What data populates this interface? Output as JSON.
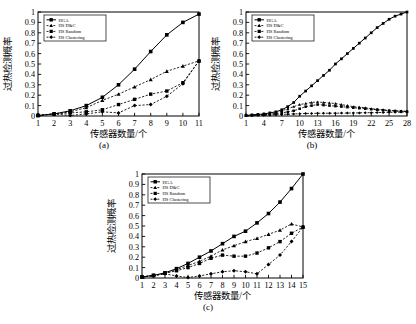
{
  "figure": {
    "axis_labels": {
      "x": "传感器数量/个",
      "y": "过热检测概率"
    },
    "series_names": [
      "HGA",
      "HS D&C",
      "HS Random",
      "HS Clustering"
    ],
    "captions": {
      "a": "(a)",
      "b": "(b)",
      "c": "(c)"
    }
  },
  "chart_data": [
    {
      "type": "line",
      "panel": "(a)",
      "title": "",
      "xlabel": "传感器数量/个",
      "ylabel": "过热检测概率",
      "xlim": [
        1,
        11
      ],
      "ylim": [
        0,
        1
      ],
      "xticks": [
        1,
        2,
        3,
        4,
        5,
        6,
        7,
        8,
        9,
        10,
        11
      ],
      "yticks": [
        0,
        0.1,
        0.2,
        0.3,
        0.4,
        0.5,
        0.6,
        0.7,
        0.8,
        0.9,
        1
      ],
      "grid": false,
      "legend_position": "top-left",
      "x": [
        1,
        2,
        3,
        4,
        5,
        6,
        7,
        8,
        9,
        10,
        11
      ],
      "series": [
        {
          "name": "HGA",
          "marker": "square",
          "linestyle": "solid",
          "values": [
            0.005,
            0.02,
            0.05,
            0.1,
            0.18,
            0.3,
            0.45,
            0.62,
            0.78,
            0.9,
            0.98
          ]
        },
        {
          "name": "HS D&C",
          "marker": "triangle",
          "linestyle": "dashed",
          "values": [
            0.005,
            0.02,
            0.04,
            0.08,
            0.15,
            0.21,
            0.28,
            0.35,
            0.43,
            0.48,
            0.53
          ]
        },
        {
          "name": "HS Random",
          "marker": "square-small",
          "linestyle": "dashed",
          "values": [
            0.005,
            0.02,
            0.03,
            0.04,
            0.06,
            0.11,
            0.16,
            0.21,
            0.24,
            0.32,
            0.53
          ]
        },
        {
          "name": "HS Clustering",
          "marker": "diamond",
          "linestyle": "dashed",
          "values": [
            0.005,
            0.02,
            0.005,
            0.02,
            0.04,
            0.03,
            0.1,
            0.11,
            0.19,
            0.31,
            0.53
          ]
        }
      ]
    },
    {
      "type": "line",
      "panel": "(b)",
      "title": "",
      "xlabel": "传感器数量/个",
      "ylabel": "过热检测概率",
      "xlim": [
        1,
        28
      ],
      "ylim": [
        0,
        1
      ],
      "xticks": [
        1,
        4,
        7,
        10,
        13,
        16,
        19,
        22,
        25,
        28
      ],
      "yticks": [
        0,
        0.1,
        0.2,
        0.3,
        0.4,
        0.5,
        0.6,
        0.7,
        0.8,
        0.9,
        1
      ],
      "grid": false,
      "legend_position": "top-left",
      "x": [
        1,
        2,
        3,
        4,
        5,
        6,
        7,
        8,
        9,
        10,
        11,
        12,
        13,
        14,
        15,
        16,
        17,
        18,
        19,
        20,
        21,
        22,
        23,
        24,
        25,
        26,
        27,
        28
      ],
      "series": [
        {
          "name": "HGA",
          "marker": "square",
          "linestyle": "solid",
          "values": [
            0.005,
            0.01,
            0.015,
            0.02,
            0.03,
            0.04,
            0.06,
            0.09,
            0.13,
            0.19,
            0.24,
            0.29,
            0.34,
            0.39,
            0.44,
            0.5,
            0.55,
            0.6,
            0.65,
            0.7,
            0.75,
            0.8,
            0.85,
            0.89,
            0.93,
            0.96,
            0.98,
            1.0
          ]
        },
        {
          "name": "HS D&C",
          "marker": "triangle",
          "linestyle": "dashed",
          "values": [
            0.005,
            0.01,
            0.012,
            0.015,
            0.02,
            0.03,
            0.05,
            0.07,
            0.09,
            0.11,
            0.12,
            0.13,
            0.135,
            0.13,
            0.125,
            0.12,
            0.11,
            0.1,
            0.09,
            0.085,
            0.08,
            0.07,
            0.065,
            0.06,
            0.055,
            0.05,
            0.048,
            0.045
          ]
        },
        {
          "name": "HS Random",
          "marker": "square-small",
          "linestyle": "dashed",
          "values": [
            0.005,
            0.008,
            0.01,
            0.012,
            0.015,
            0.02,
            0.03,
            0.04,
            0.05,
            0.07,
            0.09,
            0.1,
            0.11,
            0.105,
            0.1,
            0.095,
            0.09,
            0.085,
            0.08,
            0.075,
            0.07,
            0.065,
            0.06,
            0.055,
            0.05,
            0.048,
            0.045,
            0.042
          ]
        },
        {
          "name": "HS Clustering",
          "marker": "diamond",
          "linestyle": "dashed",
          "values": [
            0.005,
            0.006,
            0.007,
            0.008,
            0.01,
            0.012,
            0.015,
            0.018,
            0.02,
            0.022,
            0.025,
            0.025,
            0.026,
            0.026,
            0.027,
            0.027,
            0.028,
            0.028,
            0.03,
            0.03,
            0.032,
            0.032,
            0.033,
            0.034,
            0.035,
            0.036,
            0.038,
            0.04
          ]
        }
      ]
    },
    {
      "type": "line",
      "panel": "(c)",
      "title": "",
      "xlabel": "传感器数量/个",
      "ylabel": "过热检测概率",
      "xlim": [
        1,
        15
      ],
      "ylim": [
        0,
        1
      ],
      "xticks": [
        1,
        2,
        3,
        4,
        5,
        6,
        7,
        8,
        9,
        10,
        11,
        12,
        13,
        14,
        15
      ],
      "yticks": [
        0,
        0.1,
        0.2,
        0.3,
        0.4,
        0.5,
        0.6,
        0.7,
        0.8,
        0.9,
        1
      ],
      "grid": false,
      "legend_position": "top-left",
      "x": [
        1,
        2,
        3,
        4,
        5,
        6,
        7,
        8,
        9,
        10,
        11,
        12,
        13,
        14,
        15
      ],
      "series": [
        {
          "name": "HGA",
          "marker": "square",
          "linestyle": "solid",
          "values": [
            0.01,
            0.025,
            0.05,
            0.09,
            0.14,
            0.2,
            0.26,
            0.33,
            0.4,
            0.45,
            0.53,
            0.62,
            0.73,
            0.86,
            1.0
          ]
        },
        {
          "name": "HS D&C",
          "marker": "triangle",
          "linestyle": "dashed",
          "values": [
            0.01,
            0.025,
            0.045,
            0.08,
            0.12,
            0.16,
            0.21,
            0.27,
            0.31,
            0.35,
            0.38,
            0.42,
            0.46,
            0.52,
            0.49
          ]
        },
        {
          "name": "HS Random",
          "marker": "square-small",
          "linestyle": "dashed",
          "values": [
            0.01,
            0.025,
            0.045,
            0.07,
            0.1,
            0.14,
            0.19,
            0.22,
            0.21,
            0.21,
            0.24,
            0.29,
            0.35,
            0.43,
            0.49
          ]
        },
        {
          "name": "HS Clustering",
          "marker": "diamond",
          "linestyle": "dashed",
          "values": [
            0.01,
            0.02,
            0.04,
            0.02,
            0.005,
            0.02,
            0.04,
            0.06,
            0.07,
            0.06,
            0.04,
            0.13,
            0.22,
            0.35,
            0.49
          ]
        }
      ]
    }
  ]
}
